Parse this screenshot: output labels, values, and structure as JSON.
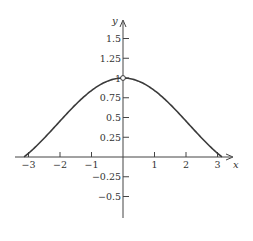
{
  "chart_data": {
    "type": "line",
    "title": "",
    "xlabel": "x",
    "ylabel": "y",
    "function": "y = sin(x)/x",
    "xlim": [
      -3.2,
      3.5
    ],
    "ylim": [
      -0.75,
      1.75
    ],
    "grid": false,
    "legend": null,
    "x_ticks": [
      -3,
      -2,
      -1,
      1,
      2,
      3
    ],
    "x_tick_labels": [
      "−3",
      "−2",
      "−1",
      "1",
      "2",
      "3"
    ],
    "y_ticks": [
      1.5,
      1.25,
      1,
      0.75,
      0.5,
      0.25,
      -0.25,
      -0.5
    ],
    "y_tick_labels": [
      "1.5",
      "1.25",
      "1",
      "0.75",
      "0.5",
      "0.25",
      "−0.25",
      "−0.5"
    ],
    "series": [
      {
        "name": "sin(x)/x",
        "x": [
          -3.14,
          -3,
          -2.5,
          -2,
          -1.5,
          -1,
          -0.5,
          0,
          0.5,
          1,
          1.5,
          2,
          2.5,
          3,
          3.14
        ],
        "values": [
          0.0,
          0.047,
          0.239,
          0.455,
          0.665,
          0.841,
          0.959,
          1.0,
          0.959,
          0.841,
          0.665,
          0.455,
          0.239,
          0.047,
          0.0
        ]
      }
    ],
    "annotations": [
      {
        "type": "open-circle",
        "x": 0,
        "y": 1,
        "note": "hole at x = 0"
      }
    ]
  }
}
